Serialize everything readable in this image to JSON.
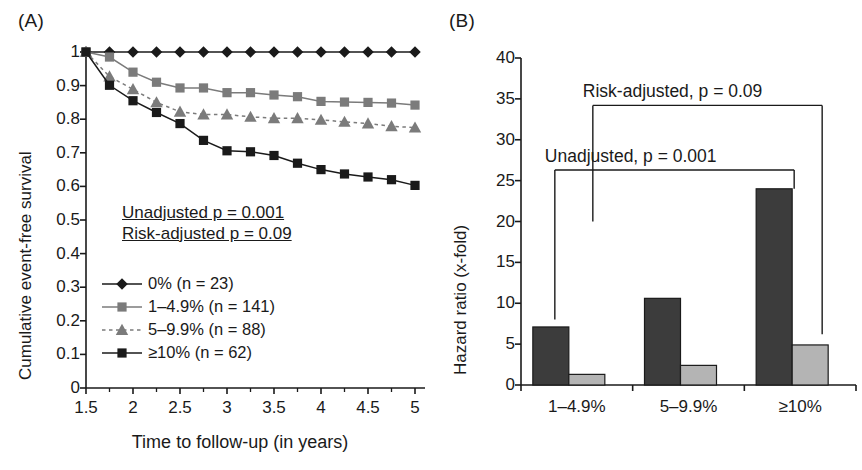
{
  "figure": {
    "panel_a_label": "(A)",
    "panel_b_label": "(B)"
  },
  "panel_a": {
    "ylabel": "Cumulative event-free survival",
    "xlabel": "Time to follow-up (in years)",
    "yticks": [
      "1",
      "0.9",
      "0.8",
      "0.7",
      "0.6",
      "0.5",
      "0.4",
      "0.3",
      "0.2",
      "0.1",
      "0"
    ],
    "xticks": [
      "1.5",
      "2",
      "2.5",
      "3",
      "3.5",
      "4",
      "4.5",
      "5"
    ],
    "annotations": {
      "unadjusted": "Unadjusted p = 0.001",
      "risk_adjusted": "Risk-adjusted p = 0.09"
    },
    "legend": [
      {
        "label": "0% (n = 23)",
        "marker": "diamond",
        "color": "#1a1a1a",
        "line": "solid"
      },
      {
        "label": "1–4.9% (n = 141)",
        "marker": "square",
        "color": "#7b7b7b",
        "line": "solid"
      },
      {
        "label": "5–9.9% (n = 88)",
        "marker": "triangle",
        "color": "#7b7b7b",
        "line": "dashed"
      },
      {
        "label": "≥10% (n = 62)",
        "marker": "square",
        "color": "#1a1a1a",
        "line": "solid"
      }
    ]
  },
  "panel_b": {
    "ylabel": "Hazard ratio (x-fold)",
    "yticks": [
      "40",
      "35",
      "30",
      "25",
      "20",
      "15",
      "10",
      "5",
      "0"
    ],
    "xticks": [
      "1–4.9%",
      "5–9.9%",
      "≥10%"
    ],
    "brackets": [
      {
        "label": "Risk-adjusted, p = 0.09",
        "top_value": 34.2,
        "left_category": 0,
        "right_category": 2,
        "left_stem_value": 20.0,
        "right_stem_value": 6.2
      },
      {
        "label": "Unadjusted, p = 0.001",
        "top_value": 26.3,
        "left_category": 0,
        "right_category": 2,
        "left_stem_value": 8.0,
        "right_stem_value": 24.0
      }
    ]
  },
  "chart_data": [
    {
      "type": "line",
      "panel": "A",
      "title": "",
      "xlabel": "Time to follow-up (in years)",
      "ylabel": "Cumulative event-free survival",
      "xlim": [
        1.5,
        5
      ],
      "ylim": [
        0,
        1
      ],
      "grid": false,
      "legend_position": "inner-left",
      "x": [
        1.5,
        1.75,
        2.0,
        2.25,
        2.5,
        2.75,
        3.0,
        3.25,
        3.5,
        3.75,
        4.0,
        4.25,
        4.5,
        4.75,
        5.0
      ],
      "series": [
        {
          "name": "0% (n = 23)",
          "marker": "diamond",
          "color": "#1a1a1a",
          "line": "solid",
          "values": [
            1.0,
            1.0,
            1.0,
            1.0,
            1.0,
            1.0,
            1.0,
            1.0,
            1.0,
            1.0,
            1.0,
            1.0,
            1.0,
            1.0,
            1.0
          ]
        },
        {
          "name": "1–4.9% (n = 141)",
          "marker": "square",
          "color": "#7b7b7b",
          "line": "solid",
          "values": [
            1.0,
            0.985,
            0.94,
            0.91,
            0.893,
            0.893,
            0.879,
            0.879,
            0.872,
            0.867,
            0.853,
            0.851,
            0.85,
            0.848,
            0.842
          ]
        },
        {
          "name": "5–9.9% (n = 88)",
          "marker": "triangle",
          "color": "#7b7b7b",
          "line": "dashed",
          "values": [
            1.0,
            0.927,
            0.889,
            0.85,
            0.822,
            0.814,
            0.814,
            0.807,
            0.803,
            0.803,
            0.798,
            0.792,
            0.787,
            0.779,
            0.775
          ]
        },
        {
          "name": "≥10% (n = 62)",
          "marker": "square",
          "color": "#1a1a1a",
          "line": "solid",
          "values": [
            1.0,
            0.901,
            0.855,
            0.82,
            0.787,
            0.737,
            0.706,
            0.703,
            0.692,
            0.669,
            0.65,
            0.637,
            0.628,
            0.62,
            0.603
          ]
        }
      ]
    },
    {
      "type": "bar",
      "panel": "B",
      "title": "",
      "xlabel": "",
      "ylabel": "Hazard ratio (x-fold)",
      "ylim": [
        0,
        40
      ],
      "grid": false,
      "categories": [
        "1–4.9%",
        "5–9.9%",
        "≥10%"
      ],
      "series": [
        {
          "name": "Unadjusted",
          "color": "#3c3c3c",
          "values": [
            7.1,
            10.6,
            24.0
          ]
        },
        {
          "name": "Risk-adjusted",
          "color": "#b4b4b4",
          "values": [
            1.3,
            2.4,
            4.9
          ]
        }
      ]
    }
  ]
}
